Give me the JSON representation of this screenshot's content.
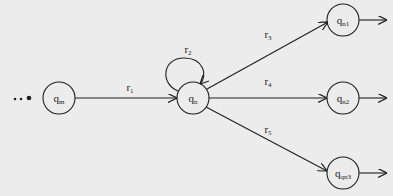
{
  "diagram": {
    "type": "state-transition-diagram",
    "continuation_marker": "...",
    "nodes": [
      {
        "id": "qm",
        "base": "q",
        "sub": "m",
        "cx": 59,
        "cy": 98
      },
      {
        "id": "qn",
        "base": "q",
        "sub": "n",
        "cx": 193,
        "cy": 98
      },
      {
        "id": "qn1",
        "base": "q",
        "sub": "n1",
        "cx": 343,
        "cy": 20
      },
      {
        "id": "qn2",
        "base": "q",
        "sub": "n2",
        "cx": 343,
        "cy": 98
      },
      {
        "id": "qn3",
        "base": "q",
        "sub": "qn3",
        "cx": 343,
        "cy": 173
      }
    ],
    "edges": [
      {
        "id": "r1",
        "from": "qm",
        "to": "qn",
        "base": "r",
        "sub": "1"
      },
      {
        "id": "r2",
        "from": "qn",
        "to": "qn",
        "base": "r",
        "sub": "2",
        "self_loop": true
      },
      {
        "id": "r3",
        "from": "qn",
        "to": "qn1",
        "base": "r",
        "sub": "3"
      },
      {
        "id": "r4",
        "from": "qn",
        "to": "qn2",
        "base": "r",
        "sub": "4"
      },
      {
        "id": "r5",
        "from": "qn",
        "to": "qn3",
        "base": "r",
        "sub": "5"
      }
    ],
    "outgoing_unlabeled_from": [
      "qn1",
      "qn2",
      "qn3"
    ],
    "colors": {
      "stroke": "#1e1e1e",
      "background": "#ececec",
      "text": "#222222"
    }
  }
}
